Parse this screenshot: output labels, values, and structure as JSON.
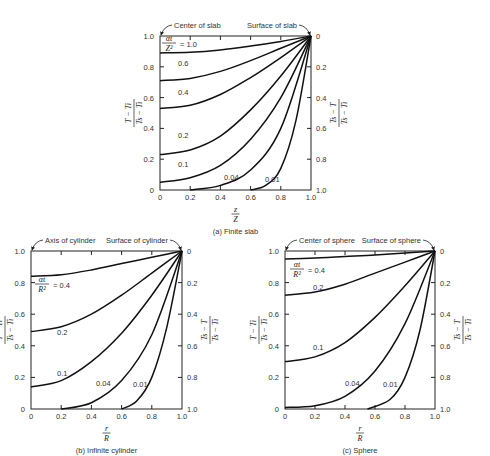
{
  "chart_data": [
    {
      "id": "a",
      "type": "line",
      "title": "(a) Finite slab",
      "annotations": {
        "left": "Center of slab",
        "right": "Surface of slab"
      },
      "xlabel": {
        "num": "z",
        "den": "Z"
      },
      "ylabel_left": {
        "num": "T − T_i",
        "den": "T_s − T_i"
      },
      "ylabel_right": {
        "num": "T_s − T",
        "den": "T_s − T_i"
      },
      "parameter": {
        "num": "αt",
        "den": "Z²"
      },
      "xlim": [
        0,
        1.0
      ],
      "ylim": [
        0,
        1.0
      ],
      "x_ticks": [
        "0",
        "0.2",
        "0.4",
        "0.6",
        "0.8",
        "1.0"
      ],
      "y_ticks_left": [
        "0",
        "0.2",
        "0.4",
        "0.6",
        "0.8",
        "1.0"
      ],
      "y_ticks_right": [
        "1.0",
        "0.8",
        "0.6",
        "0.4",
        "0.2",
        "0"
      ],
      "series": [
        {
          "name": "1.0",
          "label": "= 1.0",
          "x": [
            0,
            0.2,
            0.4,
            0.6,
            0.8,
            1.0
          ],
          "values": [
            0.89,
            0.895,
            0.91,
            0.935,
            0.965,
            1.0
          ]
        },
        {
          "name": "0.6",
          "label": "0.6",
          "x": [
            0,
            0.2,
            0.4,
            0.6,
            0.8,
            1.0
          ],
          "values": [
            0.71,
            0.725,
            0.77,
            0.84,
            0.92,
            1.0
          ]
        },
        {
          "name": "0.4",
          "label": "0.4",
          "x": [
            0,
            0.2,
            0.4,
            0.6,
            0.8,
            1.0
          ],
          "values": [
            0.53,
            0.55,
            0.62,
            0.73,
            0.86,
            1.0
          ]
        },
        {
          "name": "0.2",
          "label": "0.2",
          "x": [
            0,
            0.2,
            0.4,
            0.6,
            0.8,
            1.0
          ],
          "values": [
            0.23,
            0.26,
            0.35,
            0.52,
            0.74,
            1.0
          ]
        },
        {
          "name": "0.1",
          "label": "0.1",
          "x": [
            0,
            0.2,
            0.4,
            0.6,
            0.8,
            1.0
          ],
          "values": [
            0.05,
            0.08,
            0.16,
            0.33,
            0.6,
            1.0
          ]
        },
        {
          "name": "0.04",
          "label": "0.04",
          "x": [
            0.2,
            0.4,
            0.6,
            0.8,
            1.0
          ],
          "values": [
            0.0,
            0.03,
            0.13,
            0.4,
            1.0
          ]
        },
        {
          "name": "0.01",
          "label": "0.01",
          "x": [
            0.6,
            0.7,
            0.8,
            0.9,
            1.0
          ],
          "values": [
            0.0,
            0.03,
            0.14,
            0.45,
            1.0
          ]
        }
      ]
    },
    {
      "id": "b",
      "type": "line",
      "title": "(b) Infinite cylinder",
      "annotations": {
        "left": "Axis of cylinder",
        "right": "Surface of cylinder"
      },
      "xlabel": {
        "num": "r",
        "den": "R"
      },
      "ylabel_left": {
        "num": "T − T_i",
        "den": "T_s − T_i"
      },
      "ylabel_right": {
        "num": "T_s − T",
        "den": "T_s − T_i"
      },
      "parameter": {
        "num": "αt",
        "den": "R²"
      },
      "xlim": [
        0,
        1.0
      ],
      "ylim": [
        0,
        1.0
      ],
      "x_ticks": [
        "0",
        "0.2",
        "0.4",
        "0.6",
        "0.8",
        "1.0"
      ],
      "y_ticks_left": [
        "0",
        "0.2",
        "0.4",
        "0.6",
        "0.8",
        "1.0"
      ],
      "y_ticks_right": [
        "1.0",
        "0.8",
        "0.6",
        "0.4",
        "0.2",
        "0"
      ],
      "series": [
        {
          "name": "0.4",
          "label": "= 0.4",
          "x": [
            0,
            0.2,
            0.4,
            0.6,
            0.8,
            1.0
          ],
          "values": [
            0.84,
            0.85,
            0.88,
            0.92,
            0.96,
            1.0
          ]
        },
        {
          "name": "0.2",
          "label": "0.2",
          "x": [
            0,
            0.2,
            0.4,
            0.6,
            0.8,
            1.0
          ],
          "values": [
            0.49,
            0.52,
            0.6,
            0.72,
            0.86,
            1.0
          ]
        },
        {
          "name": "0.1",
          "label": "0.1",
          "x": [
            0,
            0.2,
            0.4,
            0.6,
            0.8,
            1.0
          ],
          "values": [
            0.14,
            0.18,
            0.3,
            0.48,
            0.72,
            1.0
          ]
        },
        {
          "name": "0.04",
          "label": "0.04",
          "x": [
            0.2,
            0.4,
            0.6,
            0.8,
            1.0
          ],
          "values": [
            0.0,
            0.04,
            0.18,
            0.47,
            1.0
          ]
        },
        {
          "name": "0.01",
          "label": "0.01",
          "x": [
            0.6,
            0.7,
            0.8,
            0.9,
            1.0
          ],
          "values": [
            0.0,
            0.05,
            0.2,
            0.52,
            1.0
          ]
        }
      ]
    },
    {
      "id": "c",
      "type": "line",
      "title": "(c) Sphere",
      "annotations": {
        "left": "Center of sphere",
        "right": "Surface of sphere"
      },
      "xlabel": {
        "num": "r",
        "den": "R"
      },
      "ylabel_left": {
        "num": "T − T_i",
        "den": "T_s − T_i"
      },
      "ylabel_right": {
        "num": "T_s − T",
        "den": "T_s − T_i"
      },
      "parameter": {
        "num": "αt",
        "den": "R²"
      },
      "xlim": [
        0,
        1.0
      ],
      "ylim": [
        0,
        1.0
      ],
      "x_ticks": [
        "0",
        "0.2",
        "0.4",
        "0.6",
        "0.8",
        "1.0"
      ],
      "y_ticks_left": [
        "0",
        "0.2",
        "0.4",
        "0.6",
        "0.8",
        "1.0"
      ],
      "y_ticks_right": [
        "1.0",
        "0.8",
        "0.6",
        "0.4",
        "0.2",
        "0"
      ],
      "series": [
        {
          "name": "0.4",
          "label": "= 0.4",
          "x": [
            0,
            0.2,
            0.4,
            0.6,
            0.8,
            1.0
          ],
          "values": [
            0.95,
            0.955,
            0.965,
            0.975,
            0.988,
            1.0
          ]
        },
        {
          "name": "0.2",
          "label": "0.2",
          "x": [
            0,
            0.2,
            0.4,
            0.6,
            0.8,
            1.0
          ],
          "values": [
            0.72,
            0.74,
            0.79,
            0.86,
            0.93,
            1.0
          ]
        },
        {
          "name": "0.1",
          "label": "0.1",
          "x": [
            0,
            0.2,
            0.4,
            0.6,
            0.8,
            1.0
          ],
          "values": [
            0.3,
            0.33,
            0.42,
            0.58,
            0.78,
            1.0
          ]
        },
        {
          "name": "0.04",
          "label": "0.04",
          "x": [
            0,
            0.2,
            0.4,
            0.6,
            0.8,
            1.0
          ],
          "values": [
            0.01,
            0.02,
            0.08,
            0.24,
            0.54,
            1.0
          ]
        },
        {
          "name": "0.01",
          "label": "0.01",
          "x": [
            0.55,
            0.7,
            0.8,
            0.9,
            1.0
          ],
          "values": [
            0.0,
            0.06,
            0.2,
            0.5,
            1.0
          ]
        }
      ]
    }
  ]
}
